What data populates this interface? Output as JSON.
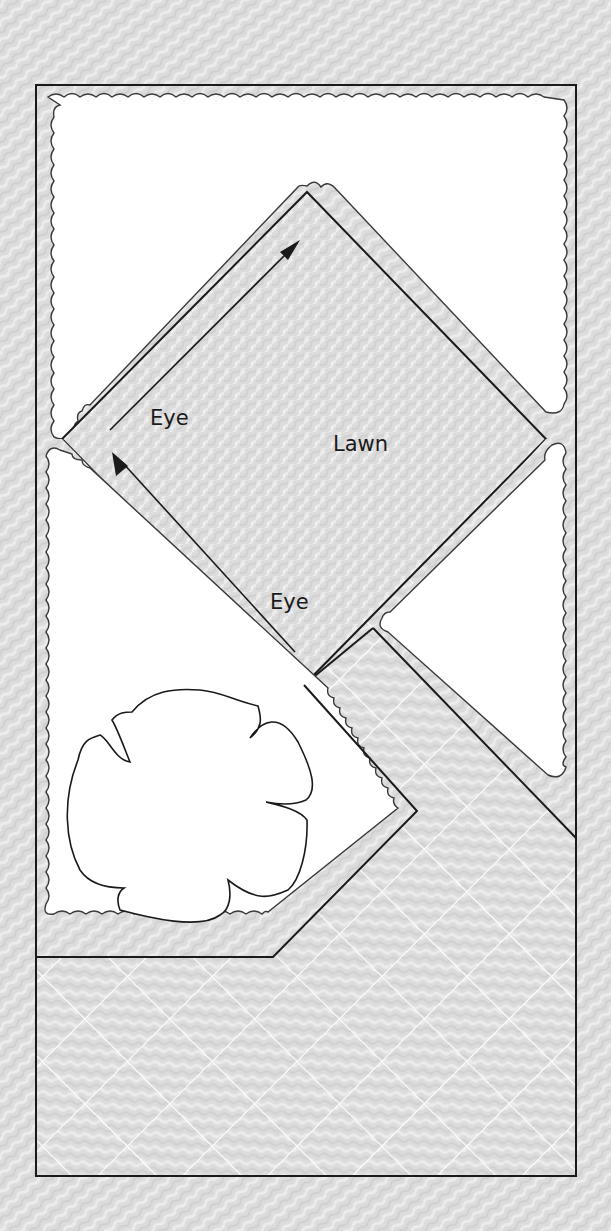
{
  "diagram": {
    "title": "",
    "background_color": "#dcdcdc",
    "paving_color": "#d6d6d6",
    "lawn_color": "#d9d9d9",
    "bed_color": "#ffffff",
    "line_color": "#1a1a1a",
    "grid_line_color": "#ffffff",
    "labels": {
      "lawn": "Lawn",
      "eye_upper": "Eye",
      "eye_lower": "Eye"
    },
    "regions": [
      {
        "name": "lawn",
        "shape": "diamond",
        "label": "Lawn"
      },
      {
        "name": "top-planting-bed",
        "shape": "irregular-scalloped"
      },
      {
        "name": "right-planting-bed",
        "shape": "triangle-scalloped"
      },
      {
        "name": "left-planting-bed-with-tree",
        "shape": "pentagon-scalloped"
      },
      {
        "name": "diagonal-paved-path",
        "shape": "band"
      },
      {
        "name": "paved-terrace",
        "shape": "rectangle-grid"
      },
      {
        "name": "tree-canopy",
        "shape": "lobed-outline"
      }
    ],
    "arrows": [
      {
        "name": "eye-arrow-upper",
        "label": "Eye",
        "direction": "up-right"
      },
      {
        "name": "eye-arrow-lower",
        "label": "Eye",
        "direction": "up-left"
      }
    ]
  }
}
